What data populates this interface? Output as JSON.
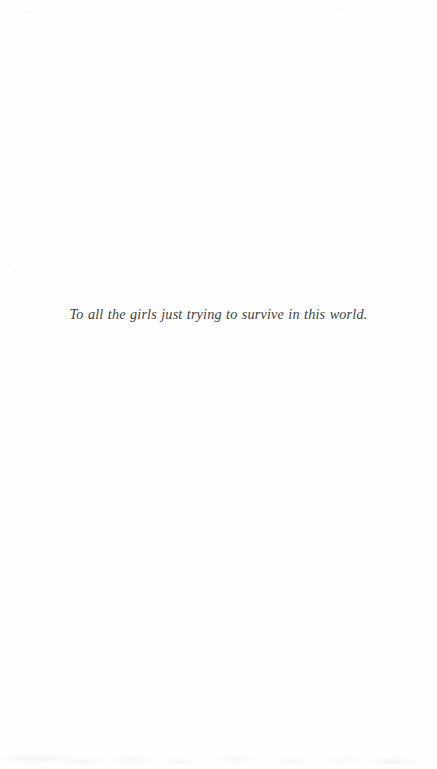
{
  "page": {
    "kind": "book-dedication-page",
    "background_color": "#fefefe",
    "width": 437,
    "height": 769
  },
  "dedication": {
    "text": "To all the girls just trying to survive in this world.",
    "style": "italic-serif",
    "alignment": "center",
    "ink_color": "#3f3f42"
  }
}
